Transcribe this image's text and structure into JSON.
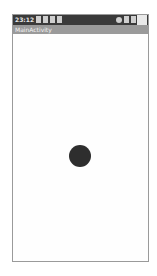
{
  "status_bar": {
    "time": "23:12",
    "left_icons": [
      "sd-card-icon",
      "usb-icon",
      "image-icon",
      "wifi-icon"
    ],
    "right_icons": [
      "alarm-icon",
      "signal-icon",
      "battery-icon"
    ],
    "color": "#3a3a3a"
  },
  "action_bar": {
    "title": "MainActivity",
    "color": "#9a9a9a"
  },
  "content": {
    "dot_color": "#2e2e2e",
    "background": "#fefefe"
  }
}
